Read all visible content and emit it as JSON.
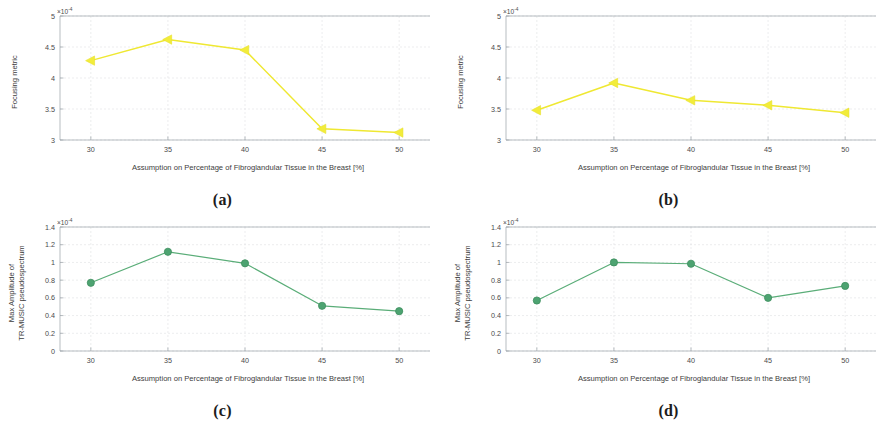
{
  "figure": {
    "background_color": "#ffffff",
    "width": 891,
    "height": 422
  },
  "colors": {
    "series_yellow": "#efe832",
    "series_green": "#4da371",
    "axis": "#9aa0a6",
    "text": "#3d3d3d"
  },
  "shared": {
    "xlabel": "Assumption on Percentage of Fibroglandular Tissue in the Breast [%]",
    "xticks": [
      "30",
      "35",
      "40",
      "45",
      "50"
    ],
    "exponent_label": "×10",
    "exponent_power": "-4"
  },
  "panels": [
    {
      "key": "a",
      "caption": "(a)"
    },
    {
      "key": "b",
      "caption": "(b)"
    },
    {
      "key": "c",
      "caption": "(c)"
    },
    {
      "key": "d",
      "caption": "(d)"
    }
  ],
  "chart_data": [
    {
      "id": "a",
      "type": "line",
      "title": "",
      "subplot_label": "(a)",
      "xlabel": "Assumption on Percentage of Fibroglandular Tissue in the Breast [%]",
      "ylabel": "Focusing metric",
      "y_exponent": "×10⁻⁴",
      "x": [
        30,
        35,
        40,
        45,
        50
      ],
      "values": [
        4.28,
        4.62,
        4.45,
        3.18,
        3.12
      ],
      "xticklabels": [
        "30",
        "35",
        "40",
        "45",
        "50"
      ],
      "yticklabels": [
        "3",
        "3.5",
        "4",
        "4.5",
        "5"
      ],
      "xlim": [
        28,
        52
      ],
      "ylim": [
        3,
        5
      ],
      "grid": true,
      "marker": "left-triangle",
      "color": "#efe832",
      "legend": null
    },
    {
      "id": "b",
      "type": "line",
      "title": "",
      "subplot_label": "(b)",
      "xlabel": "Assumption on Percentage of Fibroglandular Tissue in the Breast [%]",
      "ylabel": "Focusing metric",
      "y_exponent": "×10⁻⁴",
      "x": [
        30,
        35,
        40,
        45,
        50
      ],
      "values": [
        3.48,
        3.92,
        3.64,
        3.56,
        3.44
      ],
      "xticklabels": [
        "30",
        "35",
        "40",
        "45",
        "50"
      ],
      "yticklabels": [
        "3",
        "3.5",
        "4",
        "4.5",
        "5"
      ],
      "xlim": [
        28,
        52
      ],
      "ylim": [
        3,
        5
      ],
      "grid": true,
      "marker": "left-triangle",
      "color": "#efe832",
      "legend": null
    },
    {
      "id": "c",
      "type": "line",
      "title": "",
      "subplot_label": "(c)",
      "xlabel": "Assumption on Percentage of Fibroglandular Tissue in the Breast [%]",
      "ylabel": "Max Amplitude of TR-MUSIC pseudospectrum",
      "ylabel_line1": "Max Amplitude of",
      "ylabel_line2": "TR-MUSIC pseudospectrum",
      "y_exponent": "×10⁻⁴",
      "x": [
        30,
        35,
        40,
        45,
        50
      ],
      "values": [
        0.77,
        1.12,
        0.99,
        0.51,
        0.45
      ],
      "xticklabels": [
        "30",
        "35",
        "40",
        "45",
        "50"
      ],
      "yticklabels": [
        "0",
        "0.2",
        "0.4",
        "0.6",
        "0.8",
        "1",
        "1.2",
        "1.4"
      ],
      "xlim": [
        28,
        52
      ],
      "ylim": [
        0,
        1.4
      ],
      "grid": true,
      "marker": "circle",
      "color": "#4da371",
      "legend": null
    },
    {
      "id": "d",
      "type": "line",
      "title": "",
      "subplot_label": "(d)",
      "xlabel": "Assumption on Percentage of Fibroglandular Tissue in the Breast [%]",
      "ylabel": "Max Amplitude of TR-MUSIC pseudospectrum",
      "ylabel_line1": "Max Amplitude of",
      "ylabel_line2": "TR-MUSIC pseudospectrum",
      "y_exponent": "×10⁻⁴",
      "x": [
        30,
        35,
        40,
        45,
        50
      ],
      "values": [
        0.57,
        1.0,
        0.985,
        0.6,
        0.735
      ],
      "xticklabels": [
        "30",
        "35",
        "40",
        "45",
        "50"
      ],
      "yticklabels": [
        "0",
        "0.2",
        "0.4",
        "0.6",
        "0.8",
        "1",
        "1.2",
        "1.4"
      ],
      "xlim": [
        28,
        52
      ],
      "ylim": [
        0,
        1.4
      ],
      "grid": true,
      "marker": "circle",
      "color": "#4da371",
      "legend": null
    }
  ]
}
